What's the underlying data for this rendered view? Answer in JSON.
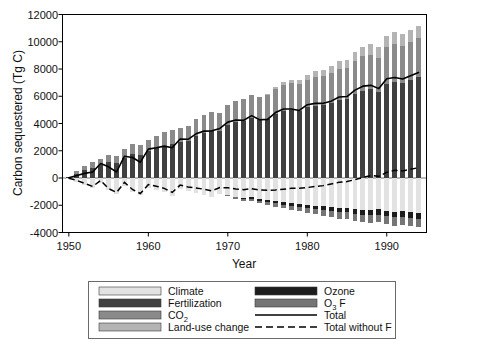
{
  "chart_data": {
    "type": "bar",
    "subtype": "stacked-bar-with-lines",
    "title": "",
    "xlabel": "Year",
    "ylabel": "Carbon sequestered (Tg C)",
    "xlim": [
      1949.2,
      1995.0
    ],
    "ylim": [
      -4000,
      12000
    ],
    "xticks": [
      1950,
      1960,
      1970,
      1980,
      1990
    ],
    "xtick_labels": [
      "1950",
      "1960",
      "1970",
      "1980",
      "1990"
    ],
    "yticks": [
      -4000,
      -2000,
      0,
      2000,
      4000,
      6000,
      8000,
      10000,
      12000
    ],
    "ytick_labels": [
      "-4000",
      "-2000",
      "0",
      "2000",
      "4000",
      "6000",
      "8000",
      "10000",
      "12000"
    ],
    "grid": false,
    "legend_position": "below-plot",
    "x": [
      1950,
      1951,
      1952,
      1953,
      1954,
      1955,
      1956,
      1957,
      1958,
      1959,
      1960,
      1961,
      1962,
      1963,
      1964,
      1965,
      1966,
      1967,
      1968,
      1969,
      1970,
      1971,
      1972,
      1973,
      1974,
      1975,
      1976,
      1977,
      1978,
      1979,
      1980,
      1981,
      1982,
      1983,
      1984,
      1985,
      1986,
      1987,
      1988,
      1989,
      1990,
      1991,
      1992,
      1993,
      1994
    ],
    "series": [
      {
        "name": "Fertilization",
        "stack": "positive",
        "color": "#404040",
        "values": [
          60,
          320,
          560,
          760,
          960,
          1180,
          1100,
          1500,
          1760,
          1700,
          1980,
          2180,
          2380,
          2500,
          2620,
          2720,
          3100,
          3340,
          3460,
          3440,
          3860,
          4080,
          4160,
          4380,
          4280,
          4360,
          4700,
          4920,
          4980,
          4940,
          5180,
          5320,
          5380,
          5540,
          5760,
          5780,
          6180,
          6420,
          6500,
          6340,
          6900,
          7080,
          6980,
          7180,
          7400
        ]
      },
      {
        "name": "CO2",
        "stack": "positive",
        "color": "#8a8a8a",
        "values": [
          40,
          180,
          300,
          380,
          460,
          540,
          520,
          660,
          760,
          740,
          840,
          900,
          980,
          1020,
          1060,
          1100,
          1240,
          1320,
          1380,
          1360,
          1520,
          1600,
          1640,
          1720,
          1680,
          1720,
          1840,
          1920,
          1960,
          1940,
          2040,
          2100,
          2120,
          2180,
          2260,
          2280,
          2420,
          2520,
          2560,
          2500,
          2700,
          2780,
          2740,
          2820,
          2900
        ]
      },
      {
        "name": "Land-use change",
        "stack": "positive",
        "color": "#b4b4b4",
        "values": [
          0,
          0,
          0,
          0,
          0,
          0,
          0,
          0,
          0,
          0,
          0,
          0,
          0,
          0,
          0,
          0,
          0,
          0,
          0,
          0,
          0,
          0,
          0,
          0,
          0,
          60,
          120,
          200,
          260,
          300,
          360,
          420,
          460,
          520,
          580,
          620,
          660,
          700,
          740,
          760,
          800,
          820,
          840,
          860,
          880
        ]
      },
      {
        "name": "Climate",
        "stack": "negative",
        "color": "#e2e2e2",
        "values": [
          -80,
          -320,
          -520,
          -700,
          -360,
          -900,
          -1180,
          -560,
          -1020,
          -1280,
          -700,
          -860,
          -1020,
          -1300,
          -820,
          -980,
          -1100,
          -1220,
          -1380,
          -1160,
          -1240,
          -1360,
          -1460,
          -1420,
          -1560,
          -1640,
          -1700,
          -1780,
          -1840,
          -1900,
          -1960,
          -2020,
          -2060,
          -2120,
          -2180,
          -2200,
          -2260,
          -2320,
          -2360,
          -2300,
          -2420,
          -2480,
          -2440,
          -2500,
          -2560
        ]
      },
      {
        "name": "Ozone",
        "stack": "negative",
        "color": "#1c1c1c",
        "values": [
          0,
          0,
          0,
          0,
          0,
          0,
          0,
          0,
          0,
          0,
          0,
          0,
          0,
          0,
          0,
          0,
          0,
          0,
          0,
          0,
          -40,
          -60,
          -80,
          -100,
          -120,
          -140,
          -160,
          -180,
          -200,
          -220,
          -240,
          -260,
          -280,
          -300,
          -320,
          -330,
          -350,
          -360,
          -380,
          -380,
          -400,
          -410,
          -410,
          -420,
          -430
        ]
      },
      {
        "name": "O3 x F",
        "stack": "negative",
        "color": "#757575",
        "values": [
          0,
          0,
          0,
          0,
          0,
          0,
          0,
          0,
          0,
          0,
          0,
          0,
          0,
          0,
          0,
          0,
          0,
          0,
          0,
          0,
          -60,
          -90,
          -120,
          -150,
          -180,
          -210,
          -240,
          -270,
          -300,
          -330,
          -360,
          -390,
          -420,
          -450,
          -480,
          -500,
          -520,
          -540,
          -560,
          -560,
          -590,
          -610,
          -610,
          -620,
          -640
        ]
      }
    ],
    "lines": [
      {
        "name": "Total",
        "style": "solid",
        "color": "#000000",
        "values": [
          20,
          180,
          340,
          440,
          1060,
          820,
          440,
          1600,
          1500,
          1160,
          2120,
          2220,
          2340,
          2220,
          2860,
          2840,
          3240,
          3440,
          3460,
          3640,
          4100,
          4260,
          4240,
          4580,
          4280,
          4300,
          4800,
          5060,
          5060,
          4960,
          5380,
          5480,
          5480,
          5640,
          5940,
          5980,
          6450,
          6740,
          6800,
          6560,
          7280,
          7380,
          7260,
          7500,
          7740
        ]
      },
      {
        "name": "Total without F",
        "style": "dashed",
        "color": "#000000",
        "values": [
          -20,
          -180,
          -400,
          -620,
          -180,
          -780,
          -1060,
          -320,
          -840,
          -1140,
          -480,
          -600,
          -760,
          -1060,
          -520,
          -660,
          -740,
          -820,
          -940,
          -700,
          -720,
          -800,
          -860,
          -780,
          -880,
          -900,
          -880,
          -820,
          -760,
          -760,
          -700,
          -620,
          -560,
          -440,
          -320,
          -260,
          -120,
          40,
          180,
          120,
          420,
          560,
          520,
          640,
          760
        ]
      }
    ],
    "legend": [
      {
        "label": "Climate",
        "swatch": "#e2e2e2",
        "kind": "swatch"
      },
      {
        "label": "Fertilization",
        "swatch": "#404040",
        "kind": "swatch"
      },
      {
        "label": "CO2",
        "label_main": "CO",
        "label_sub": "2",
        "swatch": "#8a8a8a",
        "kind": "swatch"
      },
      {
        "label": "Land-use change",
        "swatch": "#b4b4b4",
        "kind": "swatch"
      },
      {
        "label": "Ozone",
        "swatch": "#1c1c1c",
        "kind": "swatch"
      },
      {
        "label": "O3 x F",
        "label_main": "O",
        "label_sub": "3",
        "label_tail": "F",
        "swatch": "#757575",
        "kind": "swatch"
      },
      {
        "label": "Total",
        "swatch": "#000000",
        "kind": "line"
      },
      {
        "label": "Total without F",
        "swatch": "#000000",
        "kind": "line-dashed"
      }
    ]
  },
  "colors": {
    "climate": "#e2e2e2",
    "fertilization": "#404040",
    "co2": "#8a8a8a",
    "landuse": "#b4b4b4",
    "ozone": "#1c1c1c",
    "o3f": "#757575",
    "total": "#000000",
    "frame": "#000000",
    "legend_border": "#6b6b6b"
  }
}
